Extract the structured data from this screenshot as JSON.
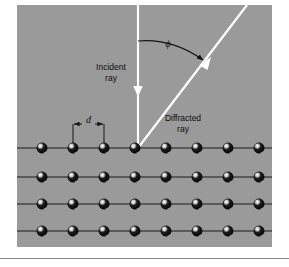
{
  "figure": {
    "type": "diagram",
    "panel": {
      "background_color": "#9a9a9a",
      "x": 17,
      "y": 5,
      "width": 255,
      "height": 242
    },
    "page_background_color": "#ffffff",
    "bottom_rule": {
      "y": 258,
      "color": "#8c8c8c"
    },
    "labels": {
      "incident_ray_line1": "Incident",
      "incident_ray_line2": "ray",
      "diffracted_ray_line1": "Diffracted",
      "diffracted_ray_line2": "ray",
      "angle_symbol": "ϕ",
      "spacing_symbol": "d"
    },
    "rays": {
      "incident": {
        "color": "#ffffff",
        "x1": 138,
        "y1": 5,
        "x2": 138,
        "y2": 148,
        "arrow_tip_y": 95,
        "direction": "downward"
      },
      "diffracted": {
        "color": "#ffffff",
        "x1": 138,
        "y1": 148,
        "x2": 247,
        "y2": 5,
        "direction": "up-right"
      }
    },
    "angle_arc": {
      "color": "#141414",
      "start_x": 138,
      "start_y": 41,
      "end_x": 206,
      "end_y": 63,
      "label_x": 168,
      "label_y": 45
    },
    "spacing_indicator": {
      "left_x": 73,
      "right_x": 104,
      "bar_y": 124,
      "tick_bottom_y": 148,
      "label_x": 88,
      "label_y": 122,
      "color": "#141414"
    },
    "lattice": {
      "rows": 4,
      "atoms_per_row": 8,
      "first_atom_x": 42,
      "atom_spacing": 31,
      "row_y": [
        148,
        177,
        204,
        231
      ],
      "atom_radius": 5.2,
      "atom_body_color": "#0a0a0a",
      "atom_highlight_color": "#f2f2f2",
      "row_line_color": "#1a1a1a",
      "row_line_x_start": 17,
      "row_line_x_end": 272
    }
  }
}
